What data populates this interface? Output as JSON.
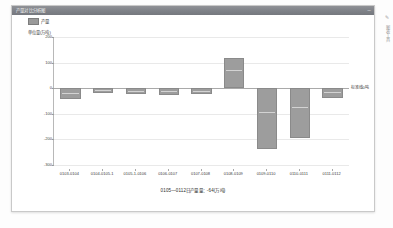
{
  "window": {
    "title": "产量对比分析图",
    "minimize_label": "─",
    "close_label": "✕"
  },
  "legend": {
    "series_label": "产量",
    "swatch_color": "#9d9d9d"
  },
  "rail": {
    "edit_icon": "✎",
    "vertical_text": "图表工具",
    "more_icon": "⋮"
  },
  "chart_data": {
    "type": "bar",
    "title": "产量对比分析图",
    "y_unit_label": "单位量(万吨)",
    "xlabel": "",
    "ylabel": "",
    "ylim": [
      -300,
      200
    ],
    "yticks": [
      200,
      100,
      0,
      -100,
      -200,
      -300
    ],
    "ytick_labels": [
      "200",
      "100",
      "0",
      "-100",
      "-200",
      "-300"
    ],
    "grid": true,
    "legend_position": "top-left",
    "zero_line_label": "标准线0吨",
    "categories": [
      "0103-0104",
      "0104-0105-1",
      "0105-1-0106",
      "0106-0107",
      "0107-0108",
      "0108-0109",
      "0109-0110",
      "0110-0111",
      "0111-0112"
    ],
    "series": [
      {
        "name": "产量",
        "values": [
          -42,
          -20,
          -22,
          -28,
          -24,
          118,
          -238,
          -196,
          -38
        ]
      }
    ],
    "caption": "0105—0112日产量量：-64(万吨)"
  }
}
